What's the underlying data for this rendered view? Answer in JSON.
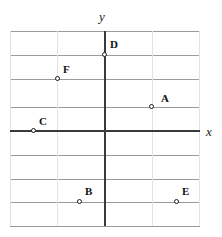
{
  "figure": {
    "type": "coordinate-plane",
    "axis_labels": {
      "x": "x",
      "y": "y"
    },
    "colors": {
      "axis": "#3a3a3a",
      "gridline_major": "#9b9b9b",
      "gridline_minor": "#e3e3e3",
      "point_stroke": "#1a1a1a",
      "label_text": "#111111",
      "background": "#ffffff"
    },
    "grid": {
      "left": 10,
      "right": 200,
      "top": 31,
      "bottom": 226,
      "origin_x": 105,
      "origin_y": 131,
      "cell_width": 47.5,
      "cell_height": 24.4,
      "horizontal_lines": [
        31,
        55,
        79,
        107,
        131,
        155,
        179,
        202,
        226
      ],
      "vertical_lines": [
        10,
        57,
        105,
        152,
        199
      ]
    }
  },
  "chart_data": {
    "type": "scatter",
    "title": "",
    "xlabel": "x",
    "ylabel": "y",
    "xlim": [
      -2,
      2
    ],
    "ylim": [
      -4,
      4
    ],
    "grid": true,
    "legend": "none",
    "points": [
      {
        "label": "A",
        "px": 152,
        "py": 107,
        "gx": 1,
        "gy": 1,
        "label_dx": 9,
        "label_dy": -14
      },
      {
        "label": "B",
        "px": 80,
        "py": 202,
        "gx": -0.5,
        "gy": -3,
        "label_dx": 5,
        "label_dy": -16
      },
      {
        "label": "C",
        "px": 34,
        "py": 131,
        "gx": -1.5,
        "gy": 0,
        "label_dx": 5,
        "label_dy": -15
      },
      {
        "label": "D",
        "px": 105,
        "py": 55,
        "gx": 0,
        "gy": 3,
        "label_dx": 5,
        "label_dy": -16
      },
      {
        "label": "E",
        "px": 177,
        "py": 202,
        "gx": 1.5,
        "gy": -3,
        "label_dx": 5,
        "label_dy": -16
      },
      {
        "label": "F",
        "px": 58,
        "py": 79,
        "gx": -1,
        "gy": 2,
        "label_dx": 5,
        "label_dy": -15
      }
    ]
  }
}
